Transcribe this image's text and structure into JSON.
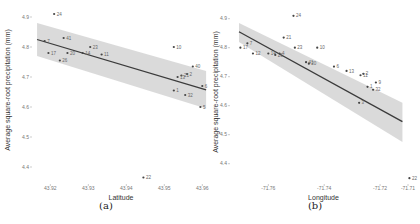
{
  "chart_data": [
    {
      "id": "a",
      "type": "scatter",
      "caption": "(a)",
      "title": "",
      "xlabel": "Latitude",
      "ylabel": "Average square-root precipitation (mm)",
      "x_ticks": [
        "43.92",
        "43.93",
        "43.94",
        "43.95",
        "43.96"
      ],
      "y_ticks": [
        "4.4",
        "4.5",
        "4.6",
        "4.7",
        "4.8",
        "4.9"
      ],
      "xlim": [
        43.9157,
        43.9615
      ],
      "ylim": [
        4.35,
        4.93
      ],
      "grid": false,
      "regression": {
        "x": [
          43.9165,
          43.961
        ],
        "y": [
          4.825,
          4.657
        ],
        "ci_upper": [
          4.88,
          4.72
        ],
        "ci_lower": [
          4.77,
          4.595
        ]
      },
      "points": [
        {
          "label": "24",
          "x": 43.921,
          "y": 4.91
        },
        {
          "label": "41",
          "x": 43.9235,
          "y": 4.83
        },
        {
          "label": "7",
          "x": 43.9185,
          "y": 4.82
        },
        {
          "label": "23",
          "x": 43.9305,
          "y": 4.8
        },
        {
          "label": "17",
          "x": 43.9195,
          "y": 4.78
        },
        {
          "label": "20",
          "x": 43.9245,
          "y": 4.78
        },
        {
          "label": "14",
          "x": 43.9285,
          "y": 4.78
        },
        {
          "label": "11",
          "x": 43.9335,
          "y": 4.775
        },
        {
          "label": "26",
          "x": 43.9225,
          "y": 4.755
        },
        {
          "label": "10",
          "x": 43.9525,
          "y": 4.8
        },
        {
          "label": "40",
          "x": 43.9575,
          "y": 4.735
        },
        {
          "label": "2",
          "x": 43.956,
          "y": 4.71
        },
        {
          "label": "21",
          "x": 43.9545,
          "y": 4.705
        },
        {
          "label": "13",
          "x": 43.9535,
          "y": 4.7
        },
        {
          "label": "6",
          "x": 43.96,
          "y": 4.67
        },
        {
          "label": "1",
          "x": 43.9525,
          "y": 4.655
        },
        {
          "label": "32",
          "x": 43.9555,
          "y": 4.64
        },
        {
          "label": "5",
          "x": 43.9595,
          "y": 4.6
        },
        {
          "label": "22",
          "x": 43.9445,
          "y": 4.365
        }
      ]
    },
    {
      "id": "b",
      "type": "scatter",
      "caption": "(b)",
      "title": "",
      "xlabel": "Longitude",
      "ylabel": "Average square-root precipitation (mm)",
      "x_ticks": [
        "-71.76",
        "-71.74",
        "-71.72",
        "-71.71"
      ],
      "y_ticks": [
        "4.4",
        "4.5",
        "4.6",
        "4.7",
        "4.8",
        "4.9"
      ],
      "xlim": [
        -71.773,
        -71.7075
      ],
      "ylim": [
        4.33,
        4.93
      ],
      "grid": false,
      "regression": {
        "x": [
          -71.7705,
          -71.712
        ],
        "y": [
          4.855,
          4.545
        ],
        "ci_upper": [
          4.885,
          4.61
        ],
        "ci_lower": [
          4.82,
          4.475
        ]
      },
      "points": [
        {
          "label": "24",
          "x": -71.751,
          "y": 4.91
        },
        {
          "label": "21",
          "x": -71.7545,
          "y": 4.835
        },
        {
          "label": "23",
          "x": -71.7505,
          "y": 4.8
        },
        {
          "label": "10",
          "x": -71.7425,
          "y": 4.8
        },
        {
          "label": "7",
          "x": -71.7675,
          "y": 4.815
        },
        {
          "label": "17",
          "x": -71.77,
          "y": 4.8
        },
        {
          "label": "12",
          "x": -71.7655,
          "y": 4.78
        },
        {
          "label": "14",
          "x": -71.76,
          "y": 4.78
        },
        {
          "label": "26",
          "x": -71.7575,
          "y": 4.775
        },
        {
          "label": "4",
          "x": -71.756,
          "y": 4.78
        },
        {
          "label": "41",
          "x": -71.7465,
          "y": 4.75
        },
        {
          "label": "20",
          "x": -71.7455,
          "y": 4.745
        },
        {
          "label": "6",
          "x": -71.7365,
          "y": 4.735
        },
        {
          "label": "13",
          "x": -71.732,
          "y": 4.72
        },
        {
          "label": "2",
          "x": -71.726,
          "y": 4.71
        },
        {
          "label": "11",
          "x": -71.727,
          "y": 4.705
        },
        {
          "label": "9",
          "x": -71.7215,
          "y": 4.68
        },
        {
          "label": "1",
          "x": -71.7245,
          "y": 4.665
        },
        {
          "label": "32",
          "x": -71.7225,
          "y": 4.655
        },
        {
          "label": "3",
          "x": -71.7275,
          "y": 4.61
        },
        {
          "label": "22",
          "x": -71.7095,
          "y": 4.35
        }
      ]
    }
  ],
  "captions": {
    "a": "(a)",
    "b": "(b)"
  },
  "colors": {
    "band": "#d3d3d3",
    "line": "#3b3b3b",
    "point": "#444444",
    "label": "#666666"
  }
}
